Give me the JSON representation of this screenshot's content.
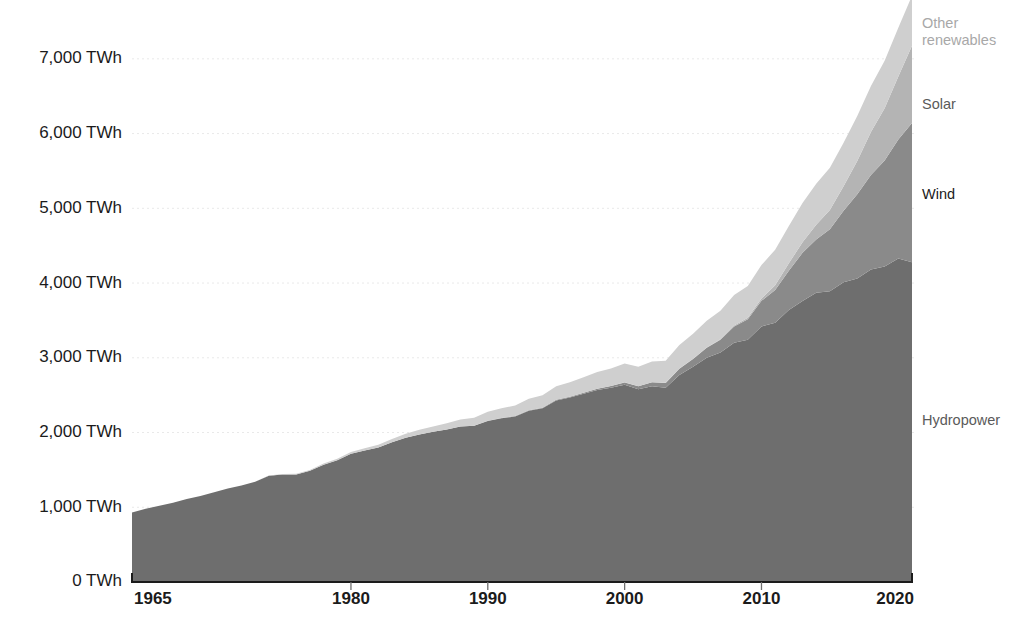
{
  "chart_data": {
    "type": "area",
    "title": "",
    "subtitle": "",
    "xlabel": "",
    "ylabel": "",
    "stacked": true,
    "grid": true,
    "legend_position": "right-inline",
    "xlim": [
      1964,
      2021
    ],
    "ylim": [
      0,
      7600
    ],
    "y_ticks": [
      0,
      1000,
      2000,
      3000,
      4000,
      5000,
      6000,
      7000
    ],
    "y_tick_labels": [
      "0 TWh",
      "1,000 TWh",
      "2,000 TWh",
      "3,000 TWh",
      "4,000 TWh",
      "5,000 TWh",
      "6,000 TWh",
      "7,000 TWh"
    ],
    "x_ticks": [
      1965,
      1980,
      1990,
      2000,
      2010,
      2020
    ],
    "x_tick_labels": [
      "1965",
      "1980",
      "1990",
      "2000",
      "2010",
      "2020"
    ],
    "unit": "TWh",
    "x": [
      1964,
      1965,
      1966,
      1967,
      1968,
      1969,
      1970,
      1971,
      1972,
      1973,
      1974,
      1975,
      1976,
      1977,
      1978,
      1979,
      1980,
      1981,
      1982,
      1983,
      1984,
      1985,
      1986,
      1987,
      1988,
      1989,
      1990,
      1991,
      1992,
      1993,
      1994,
      1995,
      1996,
      1997,
      1998,
      1999,
      2000,
      2001,
      2002,
      2003,
      2004,
      2005,
      2006,
      2007,
      2008,
      2009,
      2010,
      2011,
      2012,
      2013,
      2014,
      2015,
      2016,
      2017,
      2018,
      2019,
      2020,
      2021
    ],
    "series": [
      {
        "name": "Hydropower",
        "color": "#6e6e6e",
        "label_color": "#5a5a5a",
        "values": [
          930,
          980,
          1020,
          1060,
          1110,
          1150,
          1200,
          1250,
          1290,
          1340,
          1420,
          1440,
          1440,
          1490,
          1570,
          1630,
          1715,
          1760,
          1800,
          1870,
          1930,
          1975,
          2010,
          2040,
          2080,
          2090,
          2155,
          2190,
          2215,
          2290,
          2325,
          2430,
          2470,
          2520,
          2570,
          2600,
          2640,
          2580,
          2620,
          2600,
          2770,
          2880,
          3000,
          3070,
          3200,
          3240,
          3420,
          3470,
          3640,
          3760,
          3870,
          3890,
          4010,
          4060,
          4180,
          4220,
          4330,
          4280
        ]
      },
      {
        "name": "Wind",
        "color": "#8a8a8a",
        "label_color": "#1b1b1b",
        "values": [
          0,
          0,
          0,
          0,
          0,
          0,
          0,
          0,
          0,
          0,
          0,
          0,
          0,
          0,
          0,
          0,
          0,
          0,
          0,
          0,
          0,
          0,
          0,
          1,
          1,
          2,
          4,
          5,
          6,
          7,
          8,
          8,
          9,
          12,
          16,
          21,
          31,
          38,
          52,
          63,
          85,
          104,
          133,
          170,
          220,
          276,
          342,
          437,
          524,
          645,
          712,
          831,
          958,
          1129,
          1265,
          1420,
          1591,
          1862
        ]
      },
      {
        "name": "Solar",
        "color": "#b4b4b4",
        "label_color": "#5a5a5a",
        "values": [
          0,
          0,
          0,
          0,
          0,
          0,
          0,
          0,
          0,
          0,
          0,
          0,
          0,
          0,
          0,
          0,
          0,
          0,
          0,
          0,
          0,
          0,
          0,
          0,
          0,
          0,
          0,
          0,
          0,
          0,
          0,
          1,
          1,
          1,
          1,
          1,
          1,
          1,
          2,
          2,
          3,
          4,
          5,
          7,
          12,
          20,
          32,
          64,
          100,
          141,
          198,
          256,
          328,
          445,
          575,
          700,
          844,
          1033
        ]
      },
      {
        "name": "Other renewables",
        "color": "#cfcfcf",
        "label_color": "#a8a8a8",
        "values": [
          0,
          0,
          0,
          0,
          0,
          0,
          0,
          1,
          2,
          3,
          4,
          6,
          8,
          10,
          14,
          18,
          24,
          30,
          36,
          44,
          52,
          62,
          72,
          82,
          94,
          106,
          120,
          130,
          142,
          154,
          166,
          180,
          194,
          208,
          222,
          236,
          252,
          262,
          278,
          294,
          312,
          332,
          356,
          382,
          408,
          424,
          448,
          474,
          498,
          524,
          548,
          566,
          582,
          600,
          618,
          634,
          650,
          670
        ]
      }
    ]
  },
  "legend": {
    "items": [
      {
        "label": "Other renewables",
        "line1": "Other",
        "line2": "renewables"
      },
      {
        "label": "Solar"
      },
      {
        "label": "Wind"
      },
      {
        "label": "Hydropower"
      }
    ]
  }
}
